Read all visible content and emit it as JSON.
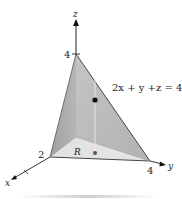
{
  "figure": {
    "axes": {
      "z_label": "z",
      "x_label": "x",
      "y_label": "y"
    },
    "ticks": {
      "z_intercept": "4",
      "x_intercept": "2",
      "y_intercept": "4"
    },
    "plane_equation": "2x + y +z = 4",
    "region_label": "R",
    "colors": {
      "left_face": "#a9a9a9",
      "right_face": "#bdbdbd",
      "base_face": "#e2e2e2",
      "edges": "#444444",
      "axes": "#222222"
    }
  }
}
